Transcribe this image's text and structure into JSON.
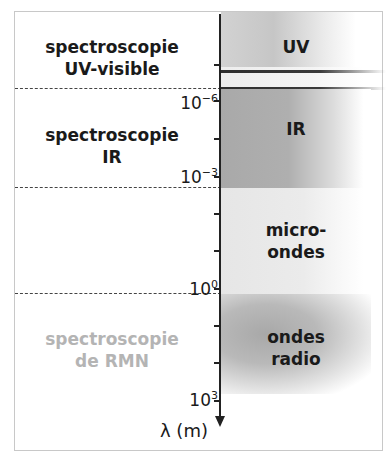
{
  "diagram": {
    "type": "electromagnetic-spectrum-scale",
    "axis": {
      "label": "λ (m)",
      "direction": "down",
      "tick_labels": [
        {
          "base": "10",
          "exp": "−6"
        },
        {
          "base": "10",
          "exp": "−3"
        },
        {
          "base": "10",
          "exp": "0"
        },
        {
          "base": "10",
          "exp": "3"
        }
      ]
    },
    "regions": {
      "uv": "UV",
      "ir": "IR",
      "micro_line1": "micro-",
      "micro_line2": "ondes",
      "radio_line1": "ondes",
      "radio_line2": "radio"
    },
    "techniques": {
      "uv_line1": "spectroscopie",
      "uv_line2": "UV-visible",
      "ir_line1": "spectroscopie",
      "ir_line2": "IR",
      "rmn_line1": "spectroscopie",
      "rmn_line2": "de RMN"
    },
    "colors": {
      "uv_band": "#c6c6c6",
      "ir_band": "#afafaf",
      "micro_band": "#ebebeb",
      "radio_band": "#b0b0b0",
      "muted_text": "#b4b4b4",
      "axis": "#222222"
    }
  }
}
